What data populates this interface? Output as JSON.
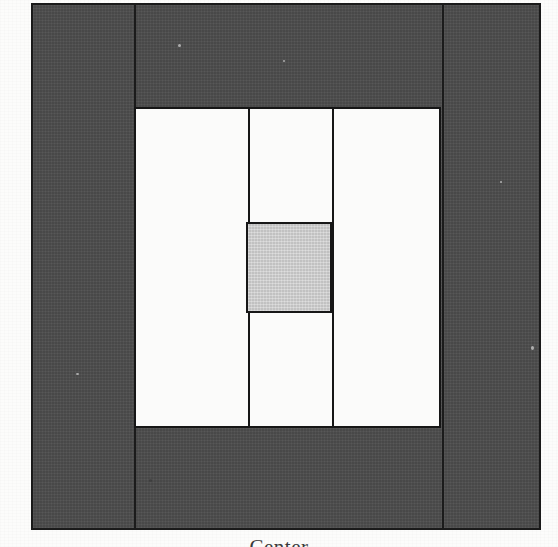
{
  "figure": {
    "domain": "diagram",
    "caption_visible_fragment": "Center",
    "colors": {
      "outer_fill": "#4c4c4c",
      "inner_fill": "#fbfbfa",
      "highlight_fill": "#c9c9c9",
      "stroke": "#161616",
      "page": "#fcfcfb"
    },
    "regions": [
      {
        "name": "outer-frame",
        "label": "outer dark square",
        "fill": "#4c4c4c",
        "x": 31,
        "y": 3,
        "width": 510,
        "height": 527
      },
      {
        "name": "frame-strip-left",
        "label": "left dark strip",
        "fill": "#4c4c4c",
        "x": 31,
        "y": 3,
        "width": 101,
        "height": 527
      },
      {
        "name": "frame-strip-middle",
        "label": "middle dark strip",
        "fill": "#4c4c4c",
        "x": 132,
        "y": 3,
        "width": 308,
        "height": 527
      },
      {
        "name": "frame-strip-right",
        "label": "right dark strip",
        "fill": "#4c4c4c",
        "x": 440,
        "y": 3,
        "width": 101,
        "height": 527
      },
      {
        "name": "inner-panel",
        "label": "inner white window",
        "fill": "#fbfbfa",
        "x": 134,
        "y": 107,
        "width": 307,
        "height": 321
      },
      {
        "name": "inner-cell-left",
        "label": "left white cell",
        "fill": "#fbfbfa",
        "x": 134,
        "y": 107,
        "width": 112,
        "height": 321
      },
      {
        "name": "inner-cell-middle-top",
        "label": "middle upper white cell",
        "fill": "#fbfbfa",
        "x": 246,
        "y": 107,
        "width": 86,
        "height": 115
      },
      {
        "name": "inner-cell-center",
        "label": "center highlighted cell",
        "fill": "#c9c9c9",
        "x": 246,
        "y": 222,
        "width": 86,
        "height": 91
      },
      {
        "name": "inner-cell-middle-bottom",
        "label": "middle lower white cell",
        "fill": "#fbfbfa",
        "x": 246,
        "y": 313,
        "width": 86,
        "height": 115
      },
      {
        "name": "inner-cell-right",
        "label": "right white cell",
        "fill": "#fbfbfa",
        "x": 332,
        "y": 107,
        "width": 109,
        "height": 321
      }
    ],
    "dividers": [
      {
        "name": "frame-seam-left",
        "orientation": "vertical",
        "x": 132
      },
      {
        "name": "frame-seam-right",
        "orientation": "vertical",
        "x": 440
      },
      {
        "name": "panel-divider-left",
        "orientation": "vertical",
        "x": 246
      },
      {
        "name": "panel-divider-right",
        "orientation": "vertical",
        "x": 332
      },
      {
        "name": "center-cell-top-edge",
        "orientation": "horizontal",
        "y": 222
      },
      {
        "name": "center-cell-bottom-edge",
        "orientation": "horizontal",
        "y": 313
      }
    ]
  },
  "caption": {
    "text": "Center",
    "note": "clipped at bottom edge of scan"
  }
}
